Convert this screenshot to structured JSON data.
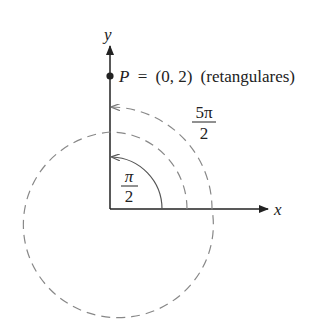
{
  "diagram": {
    "axes": {
      "x_label": "x",
      "y_label": "y"
    },
    "point": {
      "name": "P",
      "equals": "=",
      "coords": "(0, 2)",
      "note": "(retangulares)"
    },
    "angles": [
      {
        "numerator": "π",
        "denominator": "2",
        "style": "solid"
      },
      {
        "numerator": "5π",
        "denominator": "2",
        "style": "dashed"
      }
    ],
    "colors": {
      "axis": "#222222",
      "solid_arc": "#555555",
      "dashed_arc": "#888888"
    }
  }
}
